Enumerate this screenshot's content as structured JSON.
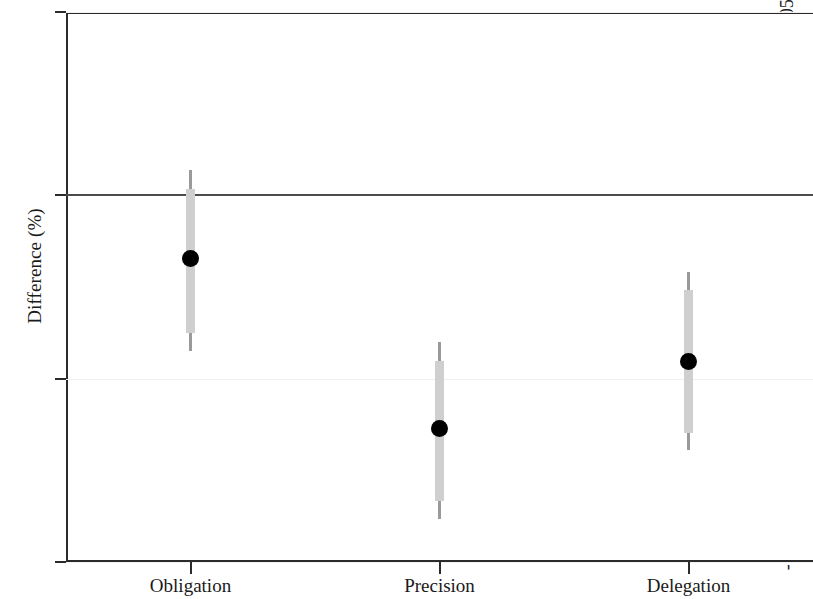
{
  "chart_data": {
    "type": "scatter",
    "title": "",
    "subtitle": "",
    "xlabel": "",
    "ylabel": "Difference (%)",
    "categories": [
      "Obligation",
      "Precision",
      "Delegation"
    ],
    "ylim": [
      -0.1,
      0.05
    ],
    "yticks": [
      0.05,
      0,
      -0.05,
      -0.1
    ],
    "ytick_labels": [
      ".05",
      "0",
      "-.05",
      "-.1"
    ],
    "grid": true,
    "grid_color": "#f2f0f1",
    "legend": "none",
    "reference_line": {
      "value": 0,
      "color": "#4c4c4c",
      "label": "0"
    },
    "series": [
      {
        "name": "Difference (%)",
        "marker": "filled-circle",
        "marker_color": "#000000",
        "ci_outer_color": "#9a9a9a",
        "ci_inner_color": "#cfcfcf",
        "points": [
          {
            "category": "Obligation",
            "value": -0.0171,
            "ci_low": -0.0425,
            "ci_high": 0.0068,
            "ci_inner_low": -0.0375,
            "ci_inner_high": 0.0017
          },
          {
            "category": "Precision",
            "value": -0.0637,
            "ci_low": -0.0882,
            "ci_high": -0.0401,
            "ci_inner_low": -0.0833,
            "ci_inner_high": -0.0451
          },
          {
            "category": "Delegation",
            "value": -0.0452,
            "ci_low": -0.0695,
            "ci_high": -0.0208,
            "ci_inner_low": -0.0647,
            "ci_inner_high": -0.0258
          }
        ]
      }
    ]
  },
  "axis": {
    "y_title": "Difference (%)",
    "y_labels": [
      ".05",
      "0",
      "-.05",
      "-.1"
    ],
    "x_labels": [
      "Obligation",
      "Precision",
      "Delegation"
    ]
  }
}
